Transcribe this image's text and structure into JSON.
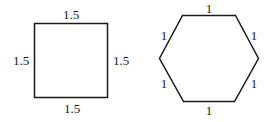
{
  "square": {
    "top_label": "1.5",
    "left_label": "1.5",
    "right_label": "1.5",
    "bottom_label": "1.5"
  },
  "hexagon": {
    "top_label": "1",
    "upper_left_label": "1",
    "upper_right_label": "1",
    "lower_left_label": "1",
    "lower_right_label": "1",
    "bottom_label": "1"
  },
  "colors": {
    "stroke": "#1a1a1a",
    "background": "#ffffff"
  }
}
